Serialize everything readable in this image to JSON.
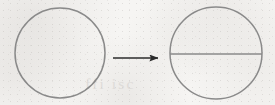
{
  "figure": {
    "caption": "",
    "background_color": "#f6f5f3",
    "stroke_color": "#8a8a8a",
    "arrow_color": "#2b2b2b",
    "bleed_through_text": "ffi isc",
    "width": 275,
    "height": 105
  },
  "shapes": {
    "left_circle": {
      "label": "circle",
      "cx": 60,
      "cy": 53,
      "r": 45,
      "stroke": "#8a8a8a",
      "stroke_width": 1.5,
      "fill": "none"
    },
    "arrow": {
      "label": "transformation arrow",
      "x_start": 113,
      "x_end": 160,
      "y": 58,
      "color": "#2b2b2b",
      "stroke_width": 1.6,
      "head": "solid-triangle"
    },
    "right_circle": {
      "label": "circle with diameter",
      "cx": 216,
      "cy": 53,
      "r": 46,
      "stroke": "#8a8a8a",
      "stroke_width": 1.5,
      "fill": "none"
    },
    "diameter_line": {
      "label": "horizontal diameter chord",
      "x1": 170,
      "x2": 262,
      "y": 54,
      "stroke": "#8a8a8a",
      "stroke_width": 1.5
    }
  }
}
